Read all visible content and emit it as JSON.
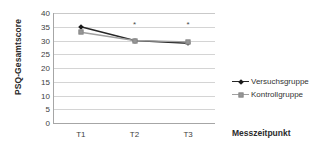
{
  "chart_data": {
    "type": "line",
    "title": "",
    "xlabel": "Messzeitpunkt",
    "ylabel": "PSQ-Gesamtscore",
    "categories": [
      "T1",
      "T2",
      "T3"
    ],
    "ylim": [
      0,
      40
    ],
    "yticks": [
      0,
      5,
      10,
      15,
      20,
      25,
      30,
      35,
      40
    ],
    "ytick_labels": [
      "0",
      "5",
      "10",
      "15",
      "20",
      "25",
      "30",
      "35",
      "40"
    ],
    "grid": true,
    "legend_position": "right",
    "series": [
      {
        "name": "Versuchsgruppe",
        "values": [
          35,
          30,
          29
        ],
        "color": "#262626",
        "marker": "diamond"
      },
      {
        "name": "Kontrollgruppe",
        "values": [
          33,
          30,
          29.5
        ],
        "color": "#a0a0a0",
        "marker": "square"
      }
    ],
    "annotations": [
      {
        "text": "*",
        "category": "T2",
        "value": 35.5
      },
      {
        "text": "*",
        "category": "T3",
        "value": 35.5
      }
    ]
  }
}
